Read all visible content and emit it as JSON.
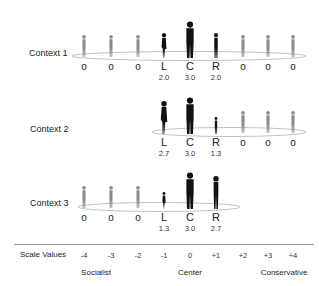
{
  "scale": {
    "label": "Scale Values",
    "ticks": [
      "-4",
      "-3",
      "-2",
      "-1",
      "0",
      "+1",
      "+2",
      "+3",
      "+4"
    ],
    "poles": [
      {
        "name": "socialist",
        "label": "Socialist"
      },
      {
        "name": "center",
        "label": "Center"
      },
      {
        "name": "conservative",
        "label": "Conservative"
      }
    ]
  },
  "contexts": [
    {
      "label": "Context 1",
      "columns": [
        "o",
        "o",
        "o",
        "L",
        "C",
        "R",
        "o",
        "o",
        "o"
      ],
      "scores": {
        "L": "2.0",
        "C": "3.0",
        "R": "2.0"
      },
      "figure_heights": {
        "L": 2.0,
        "C": 3.0,
        "R": 2.0
      }
    },
    {
      "label": "Context 2",
      "columns": [
        "",
        "",
        "",
        "L",
        "C",
        "R",
        "o",
        "o",
        "o"
      ],
      "scores": {
        "L": "2.7",
        "C": "3.0",
        "R": "1.3"
      },
      "figure_heights": {
        "L": 2.7,
        "C": 3.0,
        "R": 1.3
      }
    },
    {
      "label": "Context 3",
      "columns": [
        "o",
        "o",
        "o",
        "L",
        "C",
        "R",
        "",
        "",
        ""
      ],
      "scores": {
        "L": "1.3",
        "C": "3.0",
        "R": "2.7"
      },
      "figure_heights": {
        "L": 1.3,
        "C": 3.0,
        "R": 2.7
      }
    }
  ],
  "colors": {
    "main_figure": "#111111",
    "other_figure": "#8a8a8a",
    "ellipse": "#bbbbbb",
    "axis": "#999999"
  }
}
